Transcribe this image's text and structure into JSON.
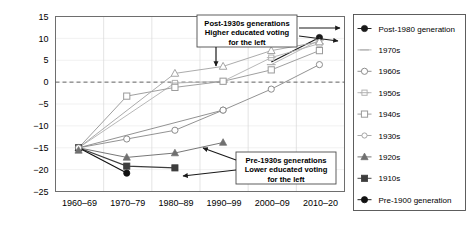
{
  "chart_data": {
    "type": "line",
    "title": "",
    "subtitle": "",
    "xlabel": "",
    "ylabel": "",
    "categories": [
      "1960–69",
      "1970–79",
      "1980–89",
      "1990–99",
      "2000–09",
      "2010–20"
    ],
    "ylim": [
      -25,
      15
    ],
    "yticks": [
      -25,
      -20,
      -15,
      -10,
      -5,
      0,
      5,
      10,
      15
    ],
    "ytick_labels": [
      "−25",
      "−20",
      "−15",
      "−10",
      "−5",
      "0",
      "5",
      "10",
      "15"
    ],
    "grid": true,
    "legend_position": "right",
    "zero_reference_line": 0,
    "series": [
      {
        "name": "Post-1980 generation",
        "marker": "filled-circle",
        "color": "#1a1a1a",
        "x": [
          "2010–20"
        ],
        "values": [
          10.2
        ]
      },
      {
        "name": "1970s",
        "marker": "dash",
        "color": "#b3b3b3",
        "x": [
          "2000–09",
          "2010–20"
        ],
        "values": [
          4.0,
          9.6
        ]
      },
      {
        "name": "1960s",
        "marker": "open-circle",
        "color": "#8c8c8c",
        "x": [
          "1990–99",
          "2000–09",
          "2010–20"
        ],
        "values": [
          -6.4,
          -1.6,
          4.0
        ]
      },
      {
        "name": "1950s",
        "marker": "open-plus",
        "color": "#b3b3b3",
        "x": [
          "1980–89",
          "1990–99",
          "2000–09",
          "2010–20"
        ],
        "values": [
          -0.2,
          0.2,
          5.6,
          8.8
        ]
      },
      {
        "name": "1940s",
        "marker": "open-square",
        "color": "#9a9a9a",
        "x": [
          "1970–79",
          "1980–89",
          "1990–99",
          "2000–09",
          "2010–20"
        ],
        "values": [
          -3.2,
          -1.2,
          0.2,
          2.8,
          7.2
        ]
      },
      {
        "name": "1930s",
        "marker": "open-triangle",
        "color": "#a6a6a6",
        "x": [
          "1980–89",
          "1990–99",
          "2000–09",
          "2010–20"
        ],
        "values": [
          2.0,
          3.6,
          7.2,
          9.2
        ]
      },
      {
        "name": "1920s",
        "marker": "filled-triangle",
        "color": "#707070",
        "x": [
          "1960–69",
          "1970–79",
          "1980–89",
          "1990–99"
        ],
        "values": [
          -15.0,
          -17.2,
          -16.2,
          -13.8
        ]
      },
      {
        "name": "1910s",
        "marker": "filled-square",
        "color": "#3d3d3d",
        "x": [
          "1960–69",
          "1970–79",
          "1980–89"
        ],
        "values": [
          -15.0,
          -19.2,
          -19.6
        ]
      },
      {
        "name": "Pre-1900 generation",
        "marker": "filled-circle",
        "color": "#111111",
        "x": [
          "1960–69",
          "1970–79"
        ],
        "values": [
          -15.0,
          -20.8
        ]
      },
      {
        "name": "1960s-lower-branch",
        "marker": "open-circle",
        "color": "#8c8c8c",
        "x": [
          "1970–79",
          "1980–89",
          "1990–99"
        ],
        "values": [
          -13.0,
          -11.0,
          -6.4
        ],
        "hidden_from_legend": true
      }
    ]
  },
  "annotations": [
    {
      "id": "callout-post-1930s",
      "lines": [
        "Post-1930s generations",
        "Higher educated voting",
        "for the left"
      ],
      "box": {
        "x": 197,
        "y": 15,
        "w": 100,
        "h": 32
      }
    },
    {
      "id": "callout-pre-1930s",
      "lines": [
        "Pre-1930s generations",
        "Lower educated voting",
        "for the left"
      ],
      "box": {
        "x": 236,
        "y": 152,
        "w": 100,
        "h": 32
      }
    }
  ],
  "legend": {
    "items": [
      {
        "label": "Post-1980 generation",
        "marker": "filled-circle",
        "color": "#1a1a1a"
      },
      {
        "label": "1970s",
        "marker": "dash",
        "color": "#b3b3b3"
      },
      {
        "label": "1960s",
        "marker": "open-circle",
        "color": "#8c8c8c"
      },
      {
        "label": "1950s",
        "marker": "open-plus",
        "color": "#b3b3b3"
      },
      {
        "label": "1940s",
        "marker": "open-square",
        "color": "#9a9a9a"
      },
      {
        "label": "1930s",
        "marker": "open-circle-small",
        "color": "#a6a6a6"
      },
      {
        "label": "1920s",
        "marker": "filled-triangle",
        "color": "#707070"
      },
      {
        "label": "1910s",
        "marker": "filled-square",
        "color": "#3d3d3d"
      },
      {
        "label": "Pre-1900 generation",
        "marker": "filled-circle",
        "color": "#111111"
      }
    ]
  },
  "colors": {
    "frame": "#6e6e6e",
    "grid_vertical": "#d9d9d9",
    "grid_horizontal": "#ebebeb",
    "zero_line": "#555555",
    "annotation_arrow": "#1a1a1a",
    "background": "#ffffff"
  }
}
